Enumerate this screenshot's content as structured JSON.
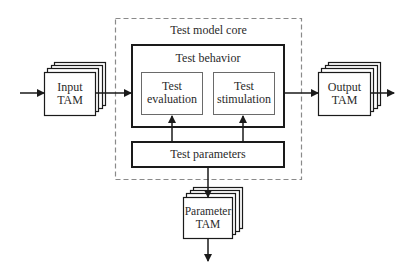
{
  "diagram": {
    "core": {
      "label": "Test model core",
      "border_style": "dashed"
    },
    "behavior": {
      "label": "Test behavior"
    },
    "evaluation": {
      "line1": "Test",
      "line2": "evaluation"
    },
    "stimulation": {
      "line1": "Test",
      "line2": "stimulation"
    },
    "parameters": {
      "label": "Test parameters"
    },
    "input_tam": {
      "line1": "Input",
      "line2": "TAM"
    },
    "output_tam": {
      "line1": "Output",
      "line2": "TAM"
    },
    "parameter_tam": {
      "line1": "Parameter",
      "line2": "TAM"
    },
    "colors": {
      "stroke": "#1a1a1a",
      "dashed": "#8a8a8a",
      "inner_stroke": "#6a6a6a",
      "text": "#2a2a2a"
    }
  }
}
